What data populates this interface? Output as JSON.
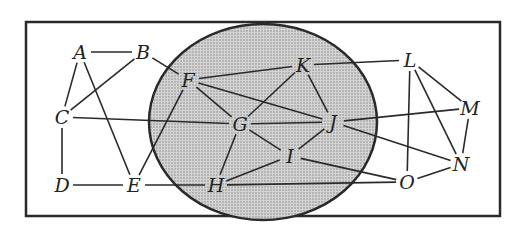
{
  "diagram": {
    "type": "graph",
    "colors": {
      "stroke": "#2a2a2a",
      "region_fill": "#c9c9c9",
      "background": "#ffffff"
    },
    "frame": {
      "x": 25,
      "y": 22,
      "w": 213,
      "h": 194
    },
    "region": {
      "cx": 263,
      "cy": 122,
      "rx": 114,
      "ry": 97
    },
    "nodes": [
      {
        "id": "A",
        "label": "A",
        "x": 80,
        "y": 52
      },
      {
        "id": "B",
        "label": "B",
        "x": 143,
        "y": 52
      },
      {
        "id": "C",
        "label": "C",
        "x": 62,
        "y": 117
      },
      {
        "id": "D",
        "label": "D",
        "x": 62,
        "y": 185
      },
      {
        "id": "E",
        "label": "E",
        "x": 134,
        "y": 185
      },
      {
        "id": "F",
        "label": "F",
        "x": 188,
        "y": 80
      },
      {
        "id": "G",
        "label": "G",
        "x": 240,
        "y": 124
      },
      {
        "id": "H",
        "label": "H",
        "x": 216,
        "y": 185
      },
      {
        "id": "I",
        "label": "I",
        "x": 290,
        "y": 156
      },
      {
        "id": "J",
        "label": "J",
        "x": 333,
        "y": 122
      },
      {
        "id": "K",
        "label": "K",
        "x": 303,
        "y": 65
      },
      {
        "id": "L",
        "label": "L",
        "x": 410,
        "y": 60
      },
      {
        "id": "M",
        "label": "M",
        "x": 470,
        "y": 108
      },
      {
        "id": "N",
        "label": "N",
        "x": 461,
        "y": 164
      },
      {
        "id": "O",
        "label": "O",
        "x": 407,
        "y": 182
      }
    ],
    "edges": [
      [
        "A",
        "B"
      ],
      [
        "A",
        "C"
      ],
      [
        "A",
        "E"
      ],
      [
        "B",
        "C"
      ],
      [
        "B",
        "F"
      ],
      [
        "C",
        "D"
      ],
      [
        "C",
        "G"
      ],
      [
        "D",
        "E"
      ],
      [
        "E",
        "F"
      ],
      [
        "E",
        "H"
      ],
      [
        "F",
        "K"
      ],
      [
        "F",
        "G"
      ],
      [
        "F",
        "J"
      ],
      [
        "G",
        "K"
      ],
      [
        "G",
        "J"
      ],
      [
        "G",
        "I"
      ],
      [
        "G",
        "H"
      ],
      [
        "K",
        "J"
      ],
      [
        "K",
        "L"
      ],
      [
        "J",
        "I"
      ],
      [
        "J",
        "M"
      ],
      [
        "J",
        "N"
      ],
      [
        "I",
        "H"
      ],
      [
        "I",
        "O"
      ],
      [
        "H",
        "O"
      ],
      [
        "L",
        "O"
      ],
      [
        "L",
        "N"
      ],
      [
        "L",
        "M"
      ],
      [
        "M",
        "N"
      ],
      [
        "N",
        "O"
      ]
    ]
  }
}
